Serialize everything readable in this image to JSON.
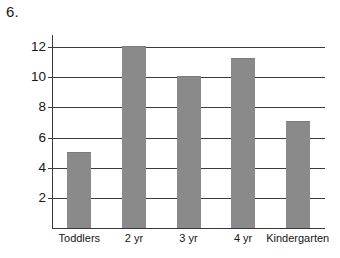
{
  "question_number": "6.",
  "chart_data": {
    "type": "bar",
    "title": "",
    "xlabel": "",
    "ylabel": "",
    "categories": [
      "Toddlers",
      "2 yr",
      "3 yr",
      "4 yr",
      "Kindergarten"
    ],
    "values": [
      5,
      12,
      10,
      11.2,
      7
    ],
    "ylim": [
      0,
      12.8
    ],
    "yticks": [
      2,
      4,
      6,
      8,
      10,
      12
    ],
    "ytick_labels": [
      "2",
      "4",
      "6",
      "8",
      "10",
      "12"
    ],
    "grid": true,
    "legend": "none",
    "bar_color": "#8a8a8a",
    "axis_color": "#3b3b3b",
    "background": "#ffffff"
  }
}
